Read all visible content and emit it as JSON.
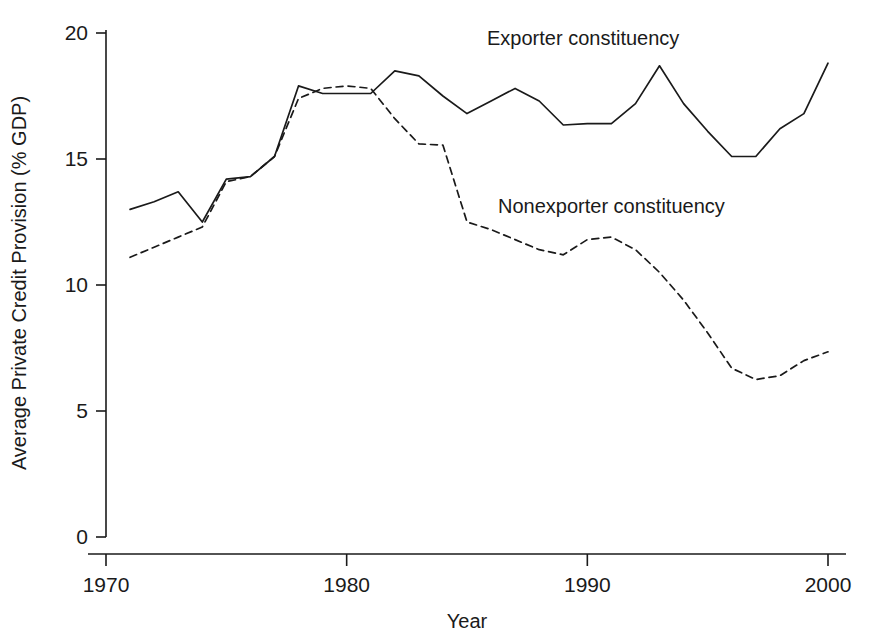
{
  "chart_data": {
    "type": "line",
    "title": "",
    "xlabel": "Year",
    "ylabel": "Average Private Credit Provision (% GDP)",
    "xlim": [
      1970,
      2000
    ],
    "ylim": [
      0,
      20
    ],
    "xticks": [
      1970,
      1980,
      1990,
      2000
    ],
    "xtick_labels": [
      "1970",
      "1980",
      "1990",
      "2000"
    ],
    "yticks": [
      0,
      5,
      10,
      15,
      20
    ],
    "ytick_labels": [
      "0",
      "5",
      "10",
      "15",
      "20"
    ],
    "grid": false,
    "legend": "inline-annotations",
    "series": [
      {
        "name": "Exporter constituency",
        "style": "solid",
        "color": "#1a1a1a",
        "label_position": {
          "x": 487,
          "y": 45
        },
        "x": [
          1971,
          1972,
          1973,
          1974,
          1975,
          1976,
          1977,
          1978,
          1979,
          1980,
          1981,
          1982,
          1983,
          1984,
          1985,
          1986,
          1987,
          1988,
          1989,
          1990,
          1991,
          1992,
          1993,
          1994,
          1995,
          1996,
          1997,
          1998,
          1999,
          2000
        ],
        "values": [
          13.0,
          13.3,
          13.7,
          12.5,
          14.2,
          14.3,
          15.1,
          17.9,
          17.6,
          17.6,
          17.6,
          18.5,
          18.3,
          17.5,
          16.8,
          17.3,
          17.8,
          17.3,
          16.35,
          16.4,
          16.4,
          17.2,
          18.7,
          17.2,
          16.1,
          15.1,
          15.1,
          16.2,
          16.8,
          18.8
        ]
      },
      {
        "name": "Nonexporter constituency",
        "style": "dashed",
        "color": "#1a1a1a",
        "label_position": {
          "x": 498,
          "y": 213
        },
        "x": [
          1971,
          1972,
          1973,
          1974,
          1975,
          1976,
          1977,
          1978,
          1979,
          1980,
          1981,
          1982,
          1983,
          1984,
          1985,
          1986,
          1987,
          1988,
          1989,
          1990,
          1991,
          1992,
          1993,
          1994,
          1995,
          1996,
          1997,
          1998,
          1999,
          2000
        ],
        "values": [
          11.1,
          11.5,
          11.9,
          12.3,
          14.1,
          14.3,
          15.1,
          17.4,
          17.8,
          17.9,
          17.8,
          16.6,
          15.6,
          15.55,
          12.5,
          12.2,
          11.8,
          11.4,
          11.2,
          11.8,
          11.9,
          11.4,
          10.5,
          9.4,
          8.1,
          6.7,
          6.25,
          6.4,
          7.0,
          7.35
        ]
      }
    ]
  },
  "axis": {
    "x_title": "Year",
    "y_title": "Average Private Credit Provision (% GDP)"
  }
}
